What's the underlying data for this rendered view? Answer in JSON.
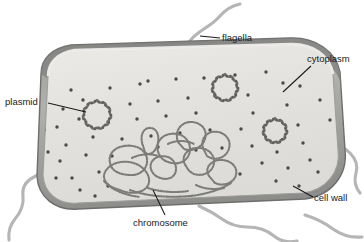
{
  "figure": {
    "background_color": "#ffffff",
    "line_color": "#2b2b2b"
  },
  "palette": {
    "cell_wall_outer": "#8e8e8e",
    "cell_wall_mid": "#a9a9a9",
    "cell_wall_inner_highlight": "#d8d8d6",
    "cytoplasm_fill": "#e2e2df",
    "cytoplasm_fill_light": "#ececea",
    "ribosome_dot": "#4a4a4a",
    "plasmid_stroke": "#6f6f6f",
    "chromosome_stroke": "#7a7a7a",
    "flagella_stroke": "#b5b5b5",
    "leader_line": "#1a1a1a",
    "label_text": "#1a1a1a"
  },
  "labels": [
    {
      "id": "flagella",
      "text": "flagella",
      "x": 222,
      "y": 41,
      "anchor": "start"
    },
    {
      "id": "cytoplasm",
      "text": "cytoplasm",
      "x": 307,
      "y": 62,
      "anchor": "start"
    },
    {
      "id": "plasmid",
      "text": "plasmid",
      "x": 5,
      "y": 105,
      "anchor": "start"
    },
    {
      "id": "cell_wall",
      "text": "cell wall",
      "x": 314,
      "y": 201,
      "anchor": "start"
    },
    {
      "id": "chromosome",
      "text": "chromosome",
      "x": 133,
      "y": 226,
      "anchor": "start"
    }
  ],
  "structures": {
    "cell_wall": {
      "name": "cell wall",
      "count": 1
    },
    "cytoplasm": {
      "name": "cytoplasm",
      "count": 1
    },
    "plasmids": {
      "name": "plasmid",
      "count": 3
    },
    "chromosome": {
      "name": "chromosome",
      "count": 1
    },
    "flagella": {
      "name": "flagella",
      "count": 4
    },
    "ribosomes": {
      "name": "ribosome",
      "count": 60
    }
  },
  "plasmid_positions": [
    {
      "cx": 97,
      "cy": 115,
      "r": 13
    },
    {
      "cx": 225,
      "cy": 88,
      "r": 12
    },
    {
      "cx": 275,
      "cy": 131,
      "r": 11
    }
  ],
  "ribosome_dots": [
    [
      71,
      90
    ],
    [
      110,
      88
    ],
    [
      140,
      84
    ],
    [
      176,
      79
    ],
    [
      204,
      78
    ],
    [
      235,
      75
    ],
    [
      266,
      72
    ],
    [
      283,
      83
    ],
    [
      63,
      109
    ],
    [
      83,
      100
    ],
    [
      130,
      104
    ],
    [
      158,
      101
    ],
    [
      188,
      98
    ],
    [
      248,
      95
    ],
    [
      300,
      86
    ],
    [
      57,
      127
    ],
    [
      79,
      119
    ],
    [
      108,
      122
    ],
    [
      137,
      119
    ],
    [
      166,
      116
    ],
    [
      196,
      113
    ],
    [
      253,
      113
    ],
    [
      287,
      105
    ],
    [
      66,
      145
    ],
    [
      93,
      137
    ],
    [
      122,
      139
    ],
    [
      151,
      136
    ],
    [
      180,
      133
    ],
    [
      210,
      130
    ],
    [
      241,
      129
    ],
    [
      298,
      125
    ],
    [
      60,
      161
    ],
    [
      86,
      155
    ],
    [
      112,
      156
    ],
    [
      196,
      150
    ],
    [
      222,
      148
    ],
    [
      252,
      146
    ],
    [
      277,
      152
    ],
    [
      303,
      143
    ],
    [
      72,
      178
    ],
    [
      99,
      172
    ],
    [
      262,
      163
    ],
    [
      288,
      168
    ],
    [
      310,
      160
    ],
    [
      80,
      190
    ],
    [
      108,
      186
    ],
    [
      240,
      174
    ],
    [
      276,
      181
    ],
    [
      299,
      186
    ],
    [
      95,
      196
    ],
    [
      318,
      172
    ],
    [
      56,
      178
    ],
    [
      148,
      81
    ],
    [
      215,
      96
    ],
    [
      44,
      130
    ],
    [
      48,
      152
    ],
    [
      330,
      120
    ],
    [
      320,
      100
    ],
    [
      158,
      147
    ]
  ]
}
